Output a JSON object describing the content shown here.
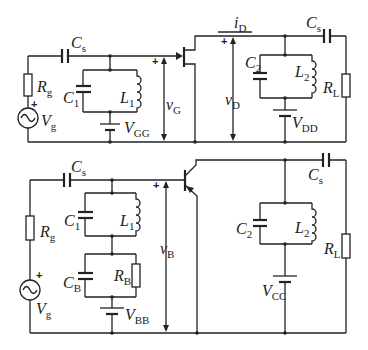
{
  "diagram": {
    "type": "circuit-schematic",
    "circuits": [
      {
        "id": "jfet-amplifier",
        "device": "n-channel JFET",
        "labels": {
          "cs_in": {
            "main": "C",
            "sub": "s"
          },
          "rg": {
            "main": "R",
            "sub": "g"
          },
          "vg": {
            "main": "V",
            "sub": "g"
          },
          "c1": {
            "main": "C",
            "sub": "1"
          },
          "l1": {
            "main": "L",
            "sub": "1"
          },
          "vgg": {
            "main": "V",
            "sub": "GG"
          },
          "v_gate": {
            "main": "v",
            "sub": "G"
          },
          "i_drain": {
            "main": "i",
            "sub": "D"
          },
          "v_drain": {
            "main": "v",
            "sub": "D"
          },
          "c2": {
            "main": "C",
            "sub": "2"
          },
          "l2": {
            "main": "L",
            "sub": "2"
          },
          "vdd": {
            "main": "V",
            "sub": "DD"
          },
          "cs_out": {
            "main": "C",
            "sub": "s"
          },
          "rl": {
            "main": "R",
            "sub": "L"
          },
          "plus": "+"
        }
      },
      {
        "id": "bjt-amplifier",
        "device": "NPN BJT",
        "labels": {
          "cs_in": {
            "main": "C",
            "sub": "s"
          },
          "rg": {
            "main": "R",
            "sub": "g"
          },
          "vg": {
            "main": "V",
            "sub": "g"
          },
          "c1": {
            "main": "C",
            "sub": "1"
          },
          "l1": {
            "main": "L",
            "sub": "1"
          },
          "cb": {
            "main": "C",
            "sub": "B"
          },
          "rb": {
            "main": "R",
            "sub": "B"
          },
          "vbb": {
            "main": "V",
            "sub": "BB"
          },
          "v_base": {
            "main": "v",
            "sub": "B"
          },
          "c2": {
            "main": "C",
            "sub": "2"
          },
          "l2": {
            "main": "L",
            "sub": "2"
          },
          "vcc": {
            "main": "V",
            "sub": "CC"
          },
          "cs_out": {
            "main": "C",
            "sub": "s"
          },
          "rl": {
            "main": "R",
            "sub": "L"
          },
          "plus": "+"
        }
      }
    ]
  }
}
